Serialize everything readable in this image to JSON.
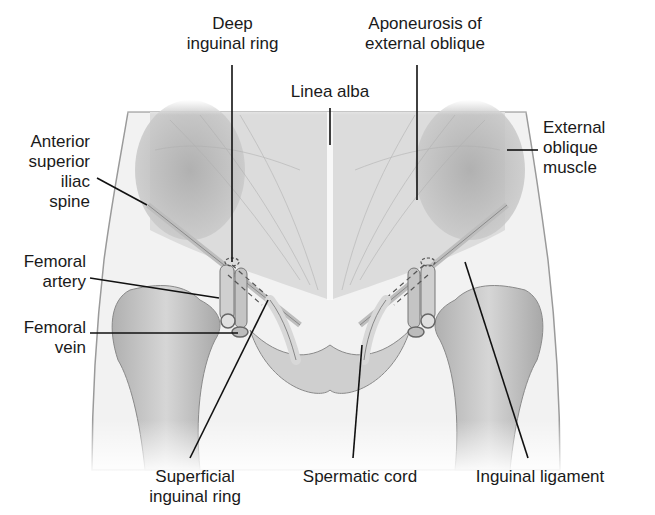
{
  "diagram": {
    "colors": {
      "background": "#ffffff",
      "skin_fill": "#f1f1f1",
      "muscle_shade": "#b9b9b9",
      "bone_shade": "#c8c8c8",
      "leader_line": "#111111",
      "label_text": "#1a1a1a"
    },
    "labels": {
      "deep_inguinal_ring": "Deep\ninguinal ring",
      "aponeurosis": "Aponeurosis of\nexternal oblique",
      "linea_alba": "Linea alba",
      "anterior_superior_iliac_spine": "Anterior\nsuperior\niliac\nspine",
      "external_oblique_muscle": "External\noblique\nmuscle",
      "femoral_artery": "Femoral\nartery",
      "femoral_vein": "Femoral\nvein",
      "superficial_inguinal_ring": "Superficial\ninguinal ring",
      "spermatic_cord": "Spermatic cord",
      "inguinal_ligament": "Inguinal ligament"
    }
  }
}
